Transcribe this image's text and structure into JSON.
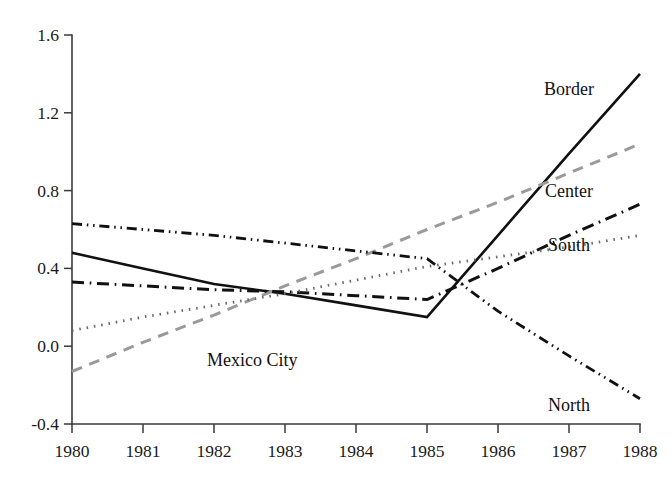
{
  "chart_data": {
    "type": "line",
    "title": "",
    "subtitle": "",
    "xlabel": "",
    "ylabel": "",
    "x": [
      1980,
      1981,
      1982,
      1983,
      1984,
      1985,
      1986,
      1987,
      1988
    ],
    "categories": [
      "1980",
      "1981",
      "1982",
      "1983",
      "1984",
      "1985",
      "1986",
      "1987",
      "1988"
    ],
    "xlim": [
      1980,
      1988
    ],
    "ylim": [
      -0.4,
      1.6
    ],
    "ytick_labels": [
      "1.6",
      "1.2",
      "0.8",
      "0.4",
      "0.0",
      "-0.4"
    ],
    "ytick_values": [
      1.6,
      1.2,
      0.8,
      0.4,
      0.0,
      -0.4
    ],
    "grid": false,
    "legend": "inline-right-labels",
    "series": [
      {
        "name": "Border",
        "label": "Border",
        "style": "solid",
        "color": "#111111",
        "width": 2.6,
        "values": [
          0.48,
          0.4,
          0.32,
          0.27,
          0.21,
          0.15,
          0.57,
          0.99,
          1.4
        ],
        "label_x": 1987.0,
        "label_y": 1.32
      },
      {
        "name": "Mexico City",
        "label": "Mexico City",
        "style": "dashed",
        "color": "#9a9a9a",
        "width": 3.0,
        "values": [
          -0.13,
          0.02,
          0.16,
          0.31,
          0.45,
          0.6,
          0.74,
          0.89,
          1.04
        ],
        "label_x": 1981.9,
        "label_y": -0.07
      },
      {
        "name": "Center",
        "label": "Center",
        "style": "dash-dot",
        "color": "#111111",
        "width": 3.0,
        "values": [
          0.33,
          0.31,
          0.29,
          0.28,
          0.26,
          0.24,
          0.4,
          0.57,
          0.73
        ],
        "label_x": 1987.0,
        "label_y": 0.8
      },
      {
        "name": "South",
        "label": "South",
        "style": "dotted",
        "color": "#6a6a6a",
        "width": 2.8,
        "values": [
          0.08,
          0.15,
          0.21,
          0.27,
          0.34,
          0.41,
          0.46,
          0.51,
          0.57
        ],
        "label_x": 1987.0,
        "label_y": 0.52
      },
      {
        "name": "North",
        "label": "North",
        "style": "dash-dot-dot",
        "color": "#111111",
        "width": 2.8,
        "values": [
          0.63,
          0.6,
          0.57,
          0.53,
          0.49,
          0.45,
          0.18,
          -0.05,
          -0.27
        ],
        "label_x": 1987.0,
        "label_y": -0.3
      }
    ]
  },
  "colors": {
    "background": "#ffffff",
    "axis": "#3a3a3a",
    "text": "#111111",
    "accent_gray": "#9a9a9a"
  }
}
